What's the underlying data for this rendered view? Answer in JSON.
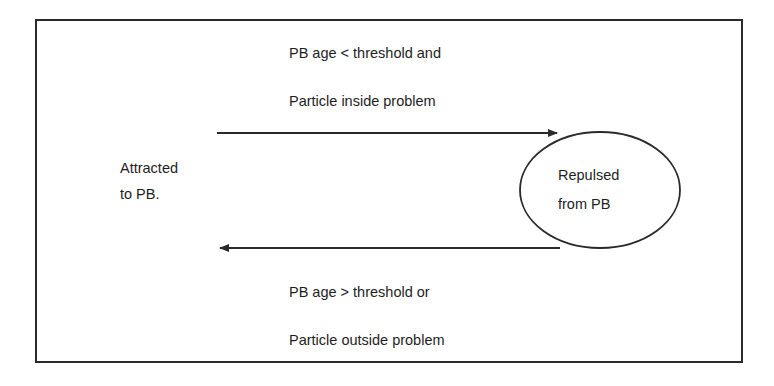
{
  "diagram": {
    "type": "state-transition",
    "states": [
      {
        "id": "attracted",
        "lines": [
          "Attracted",
          "to PB."
        ],
        "shape": "none"
      },
      {
        "id": "repulsed",
        "lines": [
          "Repulsed",
          "from PB"
        ],
        "shape": "ellipse"
      }
    ],
    "transitions": [
      {
        "from": "attracted",
        "to": "repulsed",
        "direction": "right",
        "condition_lines": [
          "PB age < threshold and",
          "Particle inside problem"
        ]
      },
      {
        "from": "repulsed",
        "to": "attracted",
        "direction": "left",
        "condition_lines": [
          "PB age > threshold or",
          "Particle outside problem"
        ]
      }
    ],
    "colors": {
      "stroke": "#2a2a2a",
      "text": "#1e1e1e",
      "background": "#ffffff"
    }
  }
}
